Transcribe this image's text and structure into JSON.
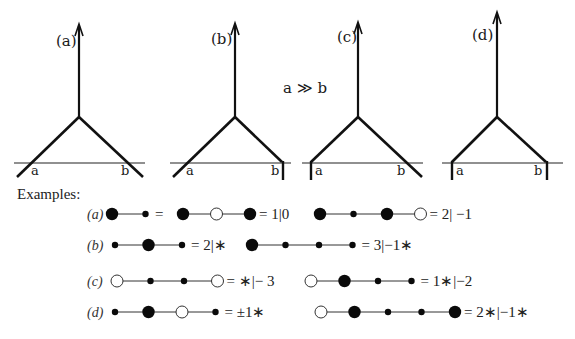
{
  "diagrams": [
    {
      "id": "a",
      "label": "(a)",
      "left_end": "a",
      "right_end": "b",
      "left_bound": false,
      "right_bound": false
    },
    {
      "id": "b",
      "label": "(b)",
      "left_end": "a",
      "right_end": "b",
      "left_bound": false,
      "right_bound": true
    },
    {
      "id": "c",
      "label": "(c)",
      "left_end": "a",
      "right_end": "b",
      "left_bound": true,
      "right_bound": false
    },
    {
      "id": "d",
      "label": "(d)",
      "left_end": "a",
      "right_end": "b",
      "left_bound": true,
      "right_bound": true
    }
  ],
  "condition": "a ≫ b",
  "examples": {
    "title": "Examples:",
    "rows": [
      {
        "label": "(a)",
        "chains": [
          {
            "parts": [
              "B",
              "s",
              "=",
              "B",
              "o",
              "B"
            ],
            "value": "= 1|0"
          },
          {
            "parts": [
              "B",
              "s",
              "B",
              "o"
            ],
            "value": "= 2| −1"
          }
        ]
      },
      {
        "label": "(b)",
        "chains": [
          {
            "parts": [
              "s",
              "B",
              "s"
            ],
            "value": "= 2|∗"
          },
          {
            "parts": [
              "B",
              "s",
              "s",
              "s"
            ],
            "value": "= 3|−1∗"
          }
        ]
      },
      {
        "label": "(c)",
        "chains": [
          {
            "parts": [
              "o",
              "s",
              "s",
              "o"
            ],
            "value": "= ∗|− 3"
          },
          {
            "parts": [
              "o",
              "B",
              "s",
              "s"
            ],
            "value": "= 1∗|−2"
          }
        ]
      },
      {
        "label": "(d)",
        "chains": [
          {
            "parts": [
              "s",
              "B",
              "o",
              "s"
            ],
            "value": "= ±1∗"
          },
          {
            "parts": [
              "o",
              "B",
              "s",
              "s",
              "B"
            ],
            "value": "= 2∗|−1∗"
          }
        ]
      }
    ]
  }
}
